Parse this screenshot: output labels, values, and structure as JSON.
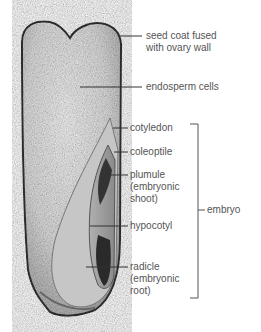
{
  "diagram": {
    "labels": {
      "seed_coat": "seed coat fused\nwith ovary wall",
      "endosperm": "endosperm cells",
      "cotyledon": "cotyledon",
      "coleoptile": "coleoptile",
      "plumule": "plumule\n(embryonic\nshoot)",
      "hypocotyl": "hypocotyl",
      "radicle": "radicle\n(embryonic\nroot)",
      "embryo": "embryo"
    },
    "colors": {
      "line": "#333333",
      "text": "#555555"
    }
  }
}
